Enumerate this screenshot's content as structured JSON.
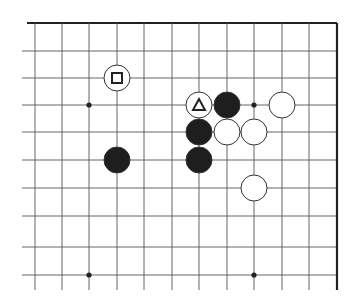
{
  "diagram": {
    "type": "go-board-fragment",
    "corner": "top-right",
    "grid": {
      "columns_x": [
        35,
        62,
        89,
        117,
        144,
        172,
        199,
        227,
        254,
        282,
        309,
        337
      ],
      "rows_y": [
        23,
        51,
        78,
        105,
        132,
        160,
        188,
        216,
        247,
        275
      ],
      "line_left_x": 22,
      "line_bottom_y": 290,
      "edge_top": true,
      "edge_right": true
    },
    "star_points": [
      {
        "col": 2,
        "row": 3
      },
      {
        "col": 8,
        "row": 3
      },
      {
        "col": 2,
        "row": 9
      },
      {
        "col": 8,
        "row": 9
      }
    ],
    "stones": [
      {
        "color": "white",
        "col": 3,
        "row": 2,
        "marker": "square"
      },
      {
        "color": "white",
        "col": 6,
        "row": 3,
        "marker": "triangle"
      },
      {
        "color": "black",
        "col": 7,
        "row": 3,
        "marker": null
      },
      {
        "color": "white",
        "col": 9,
        "row": 3,
        "marker": null
      },
      {
        "color": "black",
        "col": 6,
        "row": 4,
        "marker": null
      },
      {
        "color": "white",
        "col": 7,
        "row": 4,
        "marker": null
      },
      {
        "color": "white",
        "col": 8,
        "row": 4,
        "marker": null
      },
      {
        "color": "black",
        "col": 3,
        "row": 5,
        "marker": null
      },
      {
        "color": "black",
        "col": 6,
        "row": 5,
        "marker": null
      },
      {
        "color": "white",
        "col": 8,
        "row": 6,
        "marker": null
      }
    ],
    "colors": {
      "line": "#555555",
      "edge": "#222222",
      "black_stone": "#1e1e1e",
      "white_stone": "#ffffff",
      "stone_outline": "#333333"
    }
  }
}
